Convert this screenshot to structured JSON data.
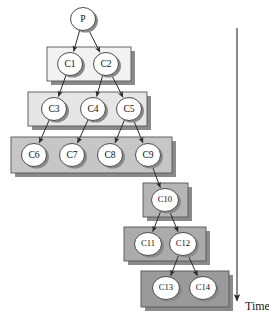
{
  "figure": {
    "type": "process-tree-diagram",
    "axis_label": "Time",
    "axis_direction": "downward",
    "background_color": "#ffffff",
    "node_fill": "#ffffff",
    "node_stroke": "#3a3a3a",
    "edge_color": "#2b2b2b",
    "shadow_color": "#8a8a8a"
  },
  "nodes": [
    {
      "id": "P",
      "label": "P",
      "cx": 83,
      "cy": 19,
      "rx": 12.5,
      "ry": 11.5,
      "tier": 0
    },
    {
      "id": "C1",
      "label": "C1",
      "cx": 70,
      "cy": 64,
      "rx": 12.5,
      "ry": 11.5,
      "tier": 1
    },
    {
      "id": "C2",
      "label": "C2",
      "cx": 106,
      "cy": 64,
      "rx": 12.5,
      "ry": 11.5,
      "tier": 1
    },
    {
      "id": "C3",
      "label": "C3",
      "cx": 54,
      "cy": 109,
      "rx": 12.5,
      "ry": 11.5,
      "tier": 2
    },
    {
      "id": "C4",
      "label": "C4",
      "cx": 93,
      "cy": 109,
      "rx": 12.5,
      "ry": 11.5,
      "tier": 2
    },
    {
      "id": "C5",
      "label": "C5",
      "cx": 129,
      "cy": 109,
      "rx": 12.5,
      "ry": 11.5,
      "tier": 2
    },
    {
      "id": "C6",
      "label": "C6",
      "cx": 34,
      "cy": 155,
      "rx": 12.5,
      "ry": 11.5,
      "tier": 3
    },
    {
      "id": "C7",
      "label": "C7",
      "cx": 72,
      "cy": 155,
      "rx": 12.5,
      "ry": 11.5,
      "tier": 3
    },
    {
      "id": "C8",
      "label": "C8",
      "cx": 110,
      "cy": 155,
      "rx": 12.5,
      "ry": 11.5,
      "tier": 3
    },
    {
      "id": "C9",
      "label": "C9",
      "cx": 148,
      "cy": 155,
      "rx": 12.5,
      "ry": 11.5,
      "tier": 3
    },
    {
      "id": "C10",
      "label": "C10",
      "cx": 165,
      "cy": 200,
      "rx": 13.5,
      "ry": 11.5,
      "tier": 4
    },
    {
      "id": "C11",
      "label": "C11",
      "cx": 148,
      "cy": 244,
      "rx": 13.5,
      "ry": 11.5,
      "tier": 5
    },
    {
      "id": "C12",
      "label": "C12",
      "cx": 183,
      "cy": 244,
      "rx": 13.5,
      "ry": 11.5,
      "tier": 5
    },
    {
      "id": "C13",
      "label": "C13",
      "cx": 166,
      "cy": 288,
      "rx": 13.5,
      "ry": 11.5,
      "tier": 6
    },
    {
      "id": "C14",
      "label": "C14",
      "cx": 203,
      "cy": 288,
      "rx": 13.5,
      "ry": 11.5,
      "tier": 6
    }
  ],
  "tier_boxes": [
    {
      "id": "tier-1-box",
      "x": 47,
      "y": 47,
      "w": 84,
      "h": 34,
      "fill": "#f2f2f2",
      "stroke": "#555555"
    },
    {
      "id": "tier-2-box",
      "x": 28,
      "y": 92,
      "w": 119,
      "h": 34,
      "fill": "#e6e6e6",
      "stroke": "#555555"
    },
    {
      "id": "tier-3-box",
      "x": 11,
      "y": 137,
      "w": 161,
      "h": 36,
      "fill": "#c6c6c6",
      "stroke": "#555555"
    },
    {
      "id": "tier-4-box",
      "x": 143,
      "y": 183,
      "w": 45,
      "h": 34,
      "fill": "#b5b5b5",
      "stroke": "#555555"
    },
    {
      "id": "tier-5-box",
      "x": 124,
      "y": 227,
      "w": 82,
      "h": 34,
      "fill": "#ababab",
      "stroke": "#555555"
    },
    {
      "id": "tier-6-box",
      "x": 141,
      "y": 271,
      "w": 88,
      "h": 36,
      "fill": "#9a9a9a",
      "stroke": "#555555"
    }
  ],
  "edges": [
    {
      "from": "P",
      "to": "C1"
    },
    {
      "from": "P",
      "to": "C2"
    },
    {
      "from": "C1",
      "to": "C3"
    },
    {
      "from": "C2",
      "to": "C4"
    },
    {
      "from": "C2",
      "to": "C5"
    },
    {
      "from": "C3",
      "to": "C6"
    },
    {
      "from": "C4",
      "to": "C7"
    },
    {
      "from": "C5",
      "to": "C8"
    },
    {
      "from": "C5",
      "to": "C9"
    },
    {
      "from": "C9",
      "to": "C10"
    },
    {
      "from": "C10",
      "to": "C11"
    },
    {
      "from": "C10",
      "to": "C12"
    },
    {
      "from": "C12",
      "to": "C13"
    },
    {
      "from": "C12",
      "to": "C14"
    }
  ],
  "time_axis": {
    "label": "Time",
    "x": 237,
    "y_start": 28,
    "y_end": 301,
    "label_x": 245,
    "label_y": 307,
    "color": "#2b2b2b"
  }
}
